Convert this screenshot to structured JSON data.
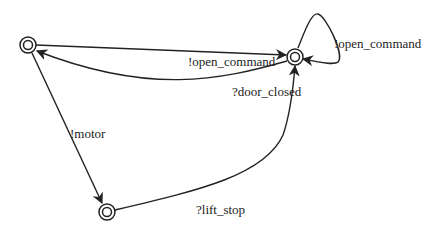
{
  "diagram": {
    "states": [
      {
        "id": "s0",
        "x": 28,
        "y": 45
      },
      {
        "id": "s1",
        "x": 295,
        "y": 57
      },
      {
        "id": "s2",
        "x": 107,
        "y": 212
      }
    ],
    "transitions": [
      {
        "from": "s0",
        "to": "s1",
        "label": "!open_command"
      },
      {
        "from": "s1",
        "to": "s0",
        "label": "?door_closed"
      },
      {
        "from": "s1",
        "to": "s1",
        "label": "!open_command"
      },
      {
        "from": "s0",
        "to": "s2",
        "label": "!motor"
      },
      {
        "from": "s2",
        "to": "s1",
        "label": "?lift_stop"
      }
    ],
    "colors": {
      "line": "#222222",
      "background": "#ffffff"
    }
  }
}
